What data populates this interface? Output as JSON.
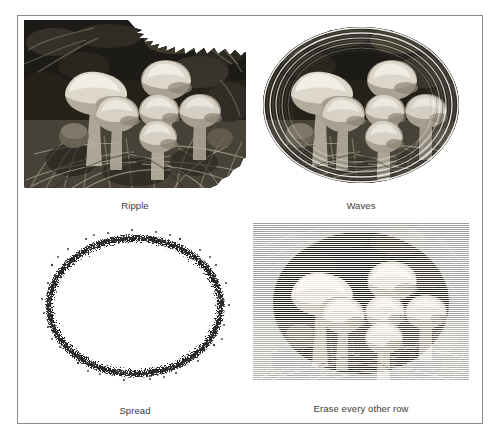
{
  "figure": {
    "background_color": "#ffffff",
    "border_color": "#8a8a8a",
    "caption_color": "#3c3c3c",
    "panels": [
      {
        "id": "ripple",
        "caption": "Ripple",
        "effect": "ripple",
        "shape": "ellipse",
        "description": "Grayscale photograph of a cluster of mushrooms in grass, masked to an ellipse with a jagged zig-zag ripple edge"
      },
      {
        "id": "waves",
        "caption": "Waves",
        "effect": "waves",
        "shape": "ellipse",
        "description": "Grayscale photograph of a cluster of mushrooms in grass, masked to an ellipse with concentric wave rings around the rim"
      },
      {
        "id": "spread",
        "caption": "Spread",
        "effect": "spread",
        "shape": "ellipse",
        "description": "Grayscale photograph of a cluster of mushrooms in grass, masked to an ellipse with a speckled scattered noise edge"
      },
      {
        "id": "erase-every-other-row",
        "caption": "Erase every other row",
        "effect": "scanlines",
        "shape": "rectangle",
        "description": "Grayscale photograph of a cluster of mushrooms in grass on a rectangle with every other horizontal row erased to white"
      }
    ]
  },
  "photo": {
    "subject": "mushroom cluster in grass",
    "palette": {
      "cap_highlight": "#f0ece4",
      "cap_mid": "#cfc8bc",
      "cap_shadow": "#8d8579",
      "grass_light": "#9a9486",
      "grass_mid": "#5d584e",
      "grass_dark": "#2a2722",
      "ground_black": "#141310"
    },
    "mushrooms": [
      {
        "id": "big-left",
        "cx": 72,
        "cy": 74,
        "rx": 30,
        "ry": 20
      },
      {
        "id": "mid-left",
        "cx": 93,
        "cy": 94,
        "rx": 21,
        "ry": 17
      },
      {
        "id": "top-right",
        "cx": 142,
        "cy": 60,
        "rx": 24,
        "ry": 19
      },
      {
        "id": "center",
        "cx": 135,
        "cy": 91,
        "rx": 19,
        "ry": 16
      },
      {
        "id": "center-low",
        "cx": 134,
        "cy": 117,
        "rx": 18,
        "ry": 15
      },
      {
        "id": "right",
        "cx": 176,
        "cy": 91,
        "rx": 20,
        "ry": 16
      }
    ]
  }
}
